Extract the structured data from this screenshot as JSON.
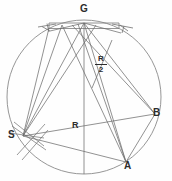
{
  "figure": {
    "type": "geometric-construction-diagram",
    "background_color": "#fefefe",
    "stroke_color": "#6e6e6e",
    "circle_stroke_color": "#808080",
    "label_color": "#2b2b2b",
    "canvas": {
      "width": 172,
      "height": 181
    },
    "circle": {
      "cx": 84,
      "cy": 97,
      "r": 77
    },
    "labels": {
      "g": "G",
      "b": "B",
      "a": "A",
      "s": "S",
      "radius": "R",
      "half_radius_numerator": "R",
      "half_radius_denominator": "2"
    },
    "points": [
      {
        "name": "G",
        "label": "G",
        "x": 84,
        "y": 21
      },
      {
        "name": "B",
        "label": "B",
        "x": 155,
        "y": 114
      },
      {
        "name": "A",
        "label": "A",
        "x": 126,
        "y": 162
      },
      {
        "name": "S",
        "label": "S",
        "x": 23,
        "y": 136
      }
    ],
    "annotations": [
      {
        "name": "radius-label",
        "text": "R",
        "x": 75,
        "y": 126
      },
      {
        "name": "half-radius-label",
        "text": "R/2",
        "x": 99,
        "y": 63
      }
    ]
  }
}
